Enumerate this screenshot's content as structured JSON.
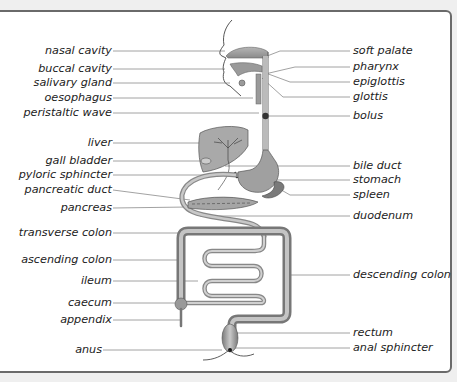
{
  "diagram": {
    "labels_left": [
      {
        "id": "nasal_cavity",
        "text": "nasal cavity",
        "y": 51
      },
      {
        "id": "buccal_cavity",
        "text": "buccal cavity",
        "y": 69
      },
      {
        "id": "salivary_gland",
        "text": "salivary gland",
        "y": 83
      },
      {
        "id": "oesophagus",
        "text": "oesophagus",
        "y": 98
      },
      {
        "id": "peristaltic_wave",
        "text": "peristaltic wave",
        "y": 113
      },
      {
        "id": "liver",
        "text": "liver",
        "y": 143
      },
      {
        "id": "gall_bladder",
        "text": "gall bladder",
        "y": 161
      },
      {
        "id": "pyloric_sphincter",
        "text": "pyloric sphincter",
        "y": 175
      },
      {
        "id": "pancreatic_duct",
        "text": "pancreatic duct",
        "y": 190
      },
      {
        "id": "pancreas",
        "text": "pancreas",
        "y": 208
      },
      {
        "id": "transverse_colon",
        "text": "transverse colon",
        "y": 233
      },
      {
        "id": "ascending_colon",
        "text": "ascending colon",
        "y": 260
      },
      {
        "id": "ileum",
        "text": "ileum",
        "y": 281
      },
      {
        "id": "caecum",
        "text": "caecum",
        "y": 303
      },
      {
        "id": "appendix",
        "text": "appendix",
        "y": 320
      },
      {
        "id": "anus",
        "text": "anus",
        "y": 350
      }
    ],
    "labels_right": [
      {
        "id": "soft_palate",
        "text": "soft palate",
        "y": 51
      },
      {
        "id": "pharynx",
        "text": "pharynx",
        "y": 67
      },
      {
        "id": "epiglottis",
        "text": "epiglottis",
        "y": 82
      },
      {
        "id": "glottis",
        "text": "glottis",
        "y": 97
      },
      {
        "id": "bolus",
        "text": "bolus",
        "y": 116
      },
      {
        "id": "bile_duct",
        "text": "bile duct",
        "y": 166
      },
      {
        "id": "stomach",
        "text": "stomach",
        "y": 180
      },
      {
        "id": "spleen",
        "text": "spleen",
        "y": 195
      },
      {
        "id": "duodenum",
        "text": "duodenum",
        "y": 216
      },
      {
        "id": "descending_colon",
        "text": "descending colon",
        "y": 275
      },
      {
        "id": "rectum",
        "text": "rectum",
        "y": 333
      },
      {
        "id": "anal_sphincter",
        "text": "anal sphincter",
        "y": 348
      }
    ],
    "colors": {
      "organ_fill": "#9a9a9a",
      "organ_light": "#c8c8c8",
      "line": "#888888",
      "text": "#222222",
      "frame_border": "#6a6a6a",
      "background": "#efefef"
    }
  }
}
